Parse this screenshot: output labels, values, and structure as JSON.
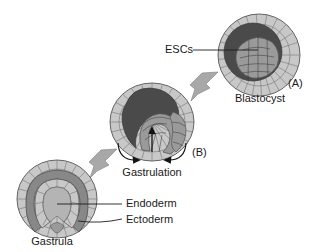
{
  "figure": {
    "background_color": "#ffffff",
    "text_color": "#1a1a1a"
  },
  "palette": {
    "outer_cell_fill": "#c8c8c8",
    "cavity_dark": "#4a4a4a",
    "inner_cell_mass": "#9a9a9a",
    "mid_layer": "#888888",
    "lumen_fill": "#b4b4b4",
    "block_arrow": "#a8a8a8",
    "cell_outline": "#6e6e6e",
    "leader_line": "#1d1d1d"
  },
  "stages": [
    {
      "id": "blastocyst",
      "panel_label": "(A)",
      "name_label": "Blastocyst",
      "callout_label": "ESCs",
      "description": "Spherical blastocyst with outer trophoblast cell layer, dark blastocoel cavity and inner cell mass"
    },
    {
      "id": "gastrulating-embryo",
      "panel_label": "(B)",
      "name_label": "",
      "callout_label": "Gastrulation",
      "description": "Embryo undergoing invagination with curved arrows indicating cell migration inward"
    },
    {
      "id": "gastrula",
      "panel_label": "",
      "name_label": "Gastrula",
      "callout_label": "",
      "description": "Gastrula with horseshoe shaped archenteron and distinct germ layers"
    }
  ],
  "annotations": {
    "escs": "ESCs",
    "blastocyst": "Blastocyst",
    "panel_a": "(A)",
    "panel_b": "(B)",
    "gastrulation": "Gastrulation",
    "endoderm": "Endoderm",
    "ectoderm": "Ectoderm",
    "gastrula": "Gastrula"
  },
  "flow": {
    "step_1": "Blastocyst to gastrulating embryo",
    "step_2": "Gastrulating embryo to gastrula"
  }
}
